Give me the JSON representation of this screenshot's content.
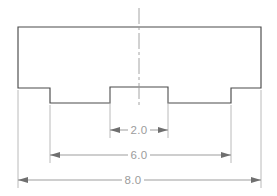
{
  "drawing": {
    "title": "Stepped block front view with width dimensions",
    "colors": {
      "outline": "#4a4a4a",
      "dimension": "#8d8d8d",
      "extension": "#a8a8a8",
      "center": "#9a9a9a",
      "text": "#9c9c9c",
      "arrow": "#6f6f6f",
      "background": "#ffffff"
    },
    "part": {
      "name": "stepped-block-profile",
      "outline_points": "18,27 261,27 261,88 231,88 231,103 168,103 168,87 110,87 110,103 50,103 50,88 18,88",
      "left_edge_x": 18,
      "right_edge_x": 261,
      "top_y": 27,
      "shoulder_y": 88,
      "notch_floor_y": 103,
      "left_step_x": 50,
      "boss_left_x": 110,
      "boss_right_x": 168,
      "boss_top_y": 87,
      "right_step_x": 231
    },
    "center_line": {
      "x": 139,
      "y_start": 8,
      "y_end": 106,
      "dash_pattern": "16,3,3,3"
    },
    "extension_lines": [
      {
        "name": "ext-left-edge",
        "x": 18,
        "y_start": 90,
        "y_end": 188
      },
      {
        "name": "ext-left-step",
        "x": 50,
        "y_start": 105,
        "y_end": 163
      },
      {
        "name": "ext-boss-left",
        "x": 110,
        "y_start": 89,
        "y_end": 138
      },
      {
        "name": "ext-boss-right",
        "x": 168,
        "y_start": 89,
        "y_end": 138
      },
      {
        "name": "ext-right-step",
        "x": 231,
        "y_start": 105,
        "y_end": 163
      },
      {
        "name": "ext-right-edge",
        "x": 261,
        "y_start": 90,
        "y_end": 188
      }
    ],
    "dimensions": [
      {
        "name": "dimension-2-0",
        "label": "2.0",
        "value": 2.0,
        "line_y": 130,
        "x_start": 110,
        "x_end": 168,
        "text_x": 139,
        "text_y": 130,
        "arrow_direction": "inward"
      },
      {
        "name": "dimension-6-0",
        "label": "6.0",
        "value": 6.0,
        "line_y": 155,
        "x_start": 50,
        "x_end": 231,
        "text_x": 139,
        "text_y": 155,
        "arrow_direction": "inward"
      },
      {
        "name": "dimension-8-0",
        "label": "8.0",
        "value": 8.0,
        "line_y": 180,
        "x_start": 18,
        "x_end": 261,
        "text_x": 133,
        "text_y": 180,
        "arrow_direction": "inward"
      }
    ]
  }
}
